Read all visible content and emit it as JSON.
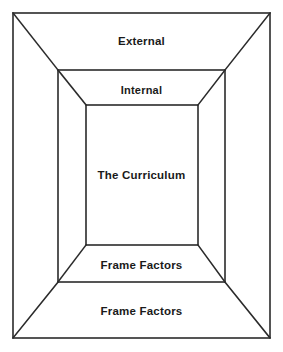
{
  "diagram": {
    "type": "nested-rectangles-perspective",
    "title": "Curriculum Frame Factors",
    "canvas": {
      "width": 283,
      "height": 352,
      "background": "#ffffff"
    },
    "line_color": "#2b2b2b",
    "text_color": "#1a1a1a",
    "rectangles": [
      {
        "id": "outer",
        "name": "outer-rectangle",
        "x1": 13,
        "y1": 13,
        "x2": 270,
        "y2": 338
      },
      {
        "id": "middle",
        "name": "middle-rectangle",
        "x1": 58,
        "y1": 70,
        "x2": 225,
        "y2": 282
      },
      {
        "id": "inner",
        "name": "inner-rectangle",
        "x1": 86,
        "y1": 105,
        "x2": 198,
        "y2": 245
      }
    ],
    "connectors": [
      {
        "name": "diagonal-outer-to-middle-top-left",
        "x1": 13,
        "y1": 13,
        "x2": 58,
        "y2": 70
      },
      {
        "name": "diagonal-outer-to-middle-top-right",
        "x1": 270,
        "y1": 13,
        "x2": 225,
        "y2": 70
      },
      {
        "name": "diagonal-outer-to-middle-bottom-left",
        "x1": 13,
        "y1": 338,
        "x2": 58,
        "y2": 282
      },
      {
        "name": "diagonal-outer-to-middle-bottom-right",
        "x1": 270,
        "y1": 338,
        "x2": 225,
        "y2": 282
      },
      {
        "name": "diagonal-middle-to-inner-top-left",
        "x1": 58,
        "y1": 70,
        "x2": 86,
        "y2": 105
      },
      {
        "name": "diagonal-middle-to-inner-top-right",
        "x1": 225,
        "y1": 70,
        "x2": 198,
        "y2": 105
      },
      {
        "name": "diagonal-middle-to-inner-bottom-left",
        "x1": 58,
        "y1": 282,
        "x2": 86,
        "y2": 245
      },
      {
        "name": "diagonal-middle-to-inner-bottom-right",
        "x1": 225,
        "y1": 282,
        "x2": 198,
        "y2": 245
      }
    ],
    "labels": {
      "external": "External",
      "internal": "Internal",
      "curriculum": "The Curriculum",
      "frame_factors_inner": "Frame Factors",
      "frame_factors_outer": "Frame Factors"
    }
  }
}
